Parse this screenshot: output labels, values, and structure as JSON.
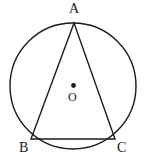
{
  "figure": {
    "stroke_color": "#1a1a1a",
    "fill_color": "#ffffff",
    "background": "#ffffff",
    "labels": {
      "apex": "A",
      "bottom_left": "B",
      "bottom_right": "C",
      "center": "O"
    },
    "geometry": {
      "circle": {
        "cx": 73,
        "cy": 86,
        "r": 63
      },
      "center_dot": {
        "cx": 73.5,
        "cy": 85.5,
        "r": 2.4
      },
      "triangle": {
        "A": {
          "x": 74,
          "y": 23
        },
        "B": {
          "x": 31,
          "y": 139
        },
        "C": {
          "x": 115,
          "y": 139
        }
      },
      "stroke_width": 1.4
    }
  }
}
